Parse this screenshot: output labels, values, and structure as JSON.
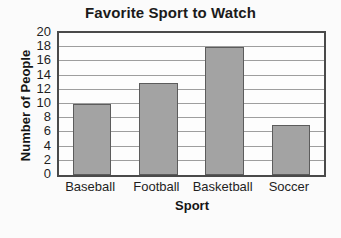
{
  "chart_data": {
    "type": "bar",
    "title": "Favorite Sport to Watch",
    "xlabel": "Sport",
    "ylabel": "Number of People",
    "categories": [
      "Baseball",
      "Football",
      "Basketball",
      "Soccer"
    ],
    "values": [
      10,
      13,
      18,
      7
    ],
    "ylim": [
      0,
      20
    ],
    "ytick_labels": [
      "0",
      "2",
      "4",
      "6",
      "8",
      "10",
      "12",
      "14",
      "16",
      "18",
      "20"
    ],
    "ytick_values": [
      0,
      2,
      4,
      6,
      8,
      10,
      12,
      14,
      16,
      18,
      20
    ],
    "grid": "horizontal",
    "legend": "none",
    "colors": {
      "bar_fill": "#a3a3a3",
      "bar_edge": "#5c5c5c",
      "plot_background": "#fdfdfd",
      "frame": "#4a4a4a",
      "gridline": "#9e9e9e",
      "text": "#1b1b1b",
      "page_background": "#fbfbfb"
    }
  }
}
